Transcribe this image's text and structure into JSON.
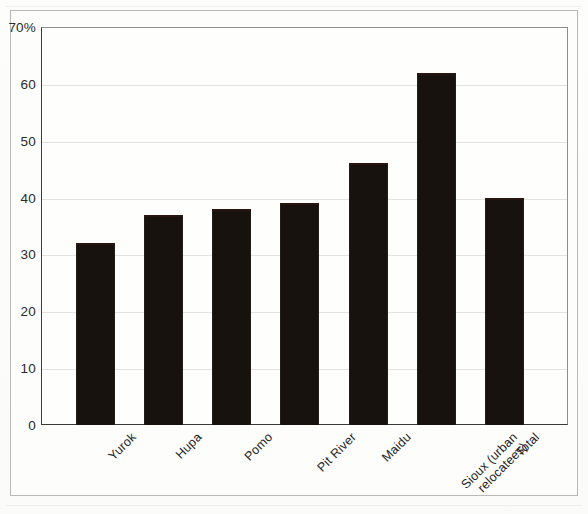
{
  "chart_data": {
    "type": "bar",
    "title": "",
    "subtitle": "",
    "xlabel": "",
    "ylabel": "",
    "categories": [
      "Yurok",
      "Hupa",
      "Pomo",
      "Pit River",
      "Maidu",
      "Sioux (urban\nrelocatees)",
      "Total"
    ],
    "values": [
      32,
      37,
      38,
      39,
      46,
      62,
      40
    ],
    "ylim": [
      0,
      70
    ],
    "ytick_labels": [
      "0",
      "10",
      "20",
      "30",
      "40",
      "50",
      "60",
      "70%"
    ],
    "ytick_values": [
      0,
      10,
      20,
      30,
      40,
      50,
      60,
      70
    ],
    "grid": true,
    "legend": false,
    "legend_position": "none",
    "bar_color": "#17120e",
    "plot_background": "#fefefc",
    "axis_color": "#3a3a38",
    "gridline_color": "#e2e2de"
  }
}
